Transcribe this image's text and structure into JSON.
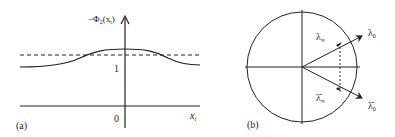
{
  "panel_a": {
    "label": "(a)",
    "y_axis_label": "−Φ₂(x_t)",
    "y_axis_label_main": "−Φ",
    "y_axis_label_sub": "2",
    "y_axis_label_arg": "(x",
    "y_axis_label_argsub": "t",
    "y_axis_label_close": ")",
    "x_axis_label": "x",
    "x_axis_label_sub": "t",
    "tick_one": "1",
    "tick_zero": "0",
    "curve": "solid bump rising from level 1 to peak above dashed line near x_t=0",
    "dashed_line": "horizontal dashed reference line slightly above 1"
  },
  "panel_b": {
    "label": "(b)",
    "lambda_inf": "λ",
    "lambda_inf_sub": "∞",
    "lambda_0": "λ",
    "lambda_0_sub": "0",
    "lambda_inf_bar": "λ̄",
    "lambda_inf_bar_sub": "∞",
    "lambda_0_bar": "λ̄",
    "lambda_0_bar_sub": "0"
  },
  "colors": {
    "stroke": "#222222",
    "background": "#ffffff"
  }
}
